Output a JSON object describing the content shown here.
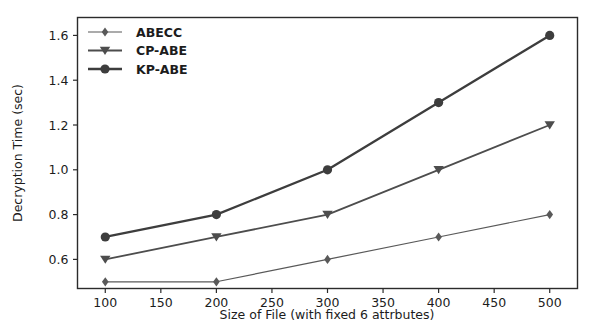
{
  "chart_data": {
    "type": "line",
    "title": "",
    "xlabel": "Size of File (with fixed 6 attrbutes)",
    "ylabel": "Decryption Time (sec)",
    "x": [
      100,
      200,
      300,
      400,
      500
    ],
    "xlim": [
      75,
      525
    ],
    "ylim": [
      0.47,
      1.68
    ],
    "xticks": [
      100,
      150,
      200,
      250,
      300,
      350,
      400,
      450,
      500
    ],
    "xtick_labels": [
      "100",
      "150",
      "200",
      "250",
      "300",
      "350",
      "400",
      "450",
      "500"
    ],
    "yticks": [
      0.6,
      0.8,
      1.0,
      1.2,
      1.4,
      1.6
    ],
    "ytick_labels": [
      "0.6",
      "0.8",
      "1.0",
      "1.2",
      "1.4",
      "1.6"
    ],
    "grid": false,
    "legend_position": "upper left",
    "series": [
      {
        "name": "ABECC",
        "marker": "diamond",
        "color": "#595959",
        "linewidth": 1.2,
        "values": [
          0.5,
          0.5,
          0.6,
          0.7,
          0.8
        ]
      },
      {
        "name": "CP-ABE",
        "marker": "triangle-down",
        "color": "#4d4d4d",
        "linewidth": 1.8,
        "values": [
          0.6,
          0.7,
          0.8,
          1.0,
          1.2
        ]
      },
      {
        "name": "KP-ABE",
        "marker": "circle",
        "color": "#3d3d3d",
        "linewidth": 2.3,
        "values": [
          0.7,
          0.8,
          1.0,
          1.3,
          1.6
        ]
      }
    ]
  },
  "legend": {
    "items": [
      {
        "label": "ABECC",
        "marker": "diamond-icon"
      },
      {
        "label": "CP-ABE",
        "marker": "triangle-down-icon"
      },
      {
        "label": "KP-ABE",
        "marker": "circle-icon"
      }
    ]
  },
  "axes": {
    "x_title": "Size of File (with fixed 6 attrbutes)",
    "y_title": "Decryption Time (sec)"
  }
}
